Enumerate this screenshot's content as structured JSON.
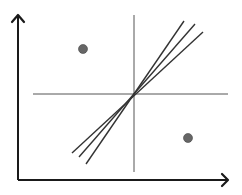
{
  "diagram": {
    "title": "",
    "axes": {
      "x_axis": {
        "label": "",
        "from": [
          18,
          180
        ],
        "to": [
          228,
          180
        ]
      },
      "y_axis": {
        "label": "",
        "from": [
          18,
          180
        ],
        "to": [
          18,
          15
        ]
      }
    },
    "quadrant_lines": {
      "vertical": {
        "x": 134,
        "y1": 15,
        "y2": 172
      },
      "horizontal": {
        "y": 94,
        "x1": 33,
        "x2": 228
      }
    },
    "center": [
      134,
      94
    ],
    "regression_lines": [
      {
        "x1": 86,
        "y1": 164,
        "x2": 184,
        "y2": 21
      },
      {
        "x1": 79,
        "y1": 157,
        "x2": 195,
        "y2": 24
      },
      {
        "x1": 72,
        "y1": 153,
        "x2": 203,
        "y2": 32
      }
    ],
    "points": [
      {
        "x": 83,
        "y": 49,
        "r": 4.5
      },
      {
        "x": 188,
        "y": 138,
        "r": 4.5
      }
    ],
    "colors": {
      "axis": "#1a1a1a",
      "quadrant_line": "#555555",
      "regression_line": "#333333",
      "point": "#666666"
    }
  }
}
